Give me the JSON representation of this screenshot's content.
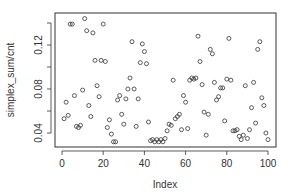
{
  "chart_data": {
    "type": "scatter",
    "title": "",
    "xlabel": "Index",
    "ylabel": "simplex_sum/cnt",
    "xlim": [
      0,
      100
    ],
    "ylim": [
      0.03,
      0.145
    ],
    "x_ticks": [
      0,
      20,
      40,
      60,
      80,
      100
    ],
    "y_ticks": [
      0.04,
      0.08,
      0.12
    ],
    "y_tick_labels": [
      "0.04",
      "0.08",
      "0.12"
    ],
    "x_tick_labels": [
      "0",
      "20",
      "40",
      "60",
      "80",
      "100"
    ],
    "grid": false,
    "legend": null,
    "marker": "open-circle",
    "marker_color": "#333333",
    "x": [
      1,
      2,
      3,
      4,
      5,
      6,
      7,
      8,
      9,
      10,
      11,
      12,
      13,
      14,
      15,
      16,
      17,
      18,
      19,
      20,
      21,
      22,
      23,
      24,
      25,
      26,
      27,
      28,
      29,
      30,
      31,
      32,
      33,
      34,
      35,
      36,
      37,
      38,
      39,
      40,
      41,
      42,
      43,
      44,
      45,
      46,
      47,
      48,
      49,
      50,
      51,
      52,
      53,
      54,
      55,
      56,
      57,
      58,
      59,
      60,
      61,
      62,
      63,
      64,
      65,
      66,
      67,
      68,
      69,
      70,
      71,
      72,
      73,
      74,
      75,
      76,
      77,
      78,
      79,
      80,
      81,
      82,
      83,
      84,
      85,
      86,
      87,
      88,
      89,
      90,
      91,
      92,
      93,
      94,
      95,
      96,
      97,
      98,
      99,
      100
    ],
    "values": [
      0.053,
      0.068,
      0.056,
      0.139,
      0.139,
      0.074,
      0.046,
      0.045,
      0.047,
      0.079,
      0.144,
      0.133,
      0.065,
      0.055,
      0.131,
      0.106,
      0.083,
      0.073,
      0.106,
      0.139,
      0.105,
      0.045,
      0.052,
      0.039,
      0.032,
      0.032,
      0.07,
      0.074,
      0.057,
      0.048,
      0.071,
      0.08,
      0.09,
      0.123,
      0.08,
      0.046,
      0.071,
      0.104,
      0.121,
      0.114,
      0.103,
      0.05,
      0.033,
      0.034,
      0.032,
      0.034,
      0.032,
      0.034,
      0.032,
      0.035,
      0.042,
      0.048,
      0.047,
      0.088,
      0.053,
      0.055,
      0.057,
      0.043,
      0.074,
      0.068,
      0.044,
      0.088,
      0.09,
      0.089,
      0.09,
      0.128,
      0.105,
      0.084,
      0.059,
      0.038,
      0.057,
      0.116,
      0.112,
      0.086,
      0.07,
      0.073,
      0.081,
      0.081,
      0.051,
      0.089,
      0.126,
      0.088,
      0.042,
      0.042,
      0.043,
      0.037,
      0.034,
      0.038,
      0.083,
      0.035,
      0.043,
      0.063,
      0.086,
      0.049,
      0.116,
      0.123,
      0.072,
      0.065,
      0.04,
      0.034
    ]
  }
}
